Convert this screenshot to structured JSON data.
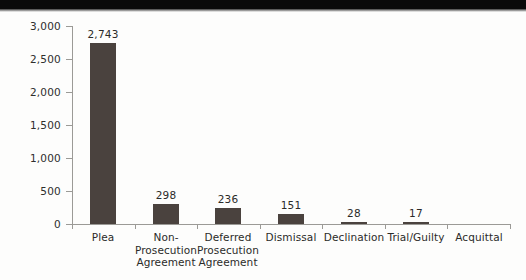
{
  "page": {
    "background_color": "#fdfdfc",
    "scan_band_color": "#0a0a0a"
  },
  "chart_data": {
    "type": "bar",
    "title": "",
    "subtitle": "",
    "xlabel": "",
    "ylabel": "",
    "orientation": "vertical",
    "grid": false,
    "legend": false,
    "legend_position": "none",
    "bar_color": "#4a423e",
    "axis_color": "#9b9a96",
    "text_color": "#2b2b29",
    "ylim": [
      0,
      3000
    ],
    "ytick_values": [
      0,
      500,
      1000,
      1500,
      2000,
      2500,
      3000
    ],
    "ytick_labels": [
      "0",
      "500",
      "1,000",
      "1,500",
      "2,000",
      "2,500",
      "3,000"
    ],
    "categories": [
      "Plea",
      "Non-\nProsecution\nAgreement",
      "Deferred\nProsecution\nAgreement",
      "Dismissal",
      "Declination",
      "Trial/Guilty",
      "Acquittal"
    ],
    "values": [
      2743,
      298,
      236,
      151,
      28,
      17,
      0
    ],
    "value_labels": [
      "2,743",
      "298",
      "236",
      "151",
      "28",
      "17",
      ""
    ],
    "bars": [
      {
        "category": "Plea",
        "category_display": "Plea",
        "value": 2743,
        "label": "2,743",
        "center_x": 105,
        "width": 26
      },
      {
        "category": "Non-Prosecution Agreement",
        "category_display": "Non-\nProsecution\nAgreement",
        "value": 298,
        "label": "298",
        "center_x": 172,
        "width": 26
      },
      {
        "category": "Deferred Prosecution Agreement",
        "category_display": "Deferred\nProsecution\nAgreement",
        "value": 236,
        "label": "236",
        "center_x": 238,
        "width": 26
      },
      {
        "category": "Dismissal",
        "category_display": "Dismissal",
        "value": 151,
        "label": "151",
        "center_x": 305,
        "width": 26
      },
      {
        "category": "Declination",
        "category_display": "Declination",
        "value": 28,
        "label": "28",
        "center_x": 372,
        "width": 26
      },
      {
        "category": "Trial/Guilty",
        "category_display": "Trial/Guilty",
        "value": 17,
        "label": "17",
        "center_x": 438,
        "width": 26
      },
      {
        "category": "Acquittal",
        "category_display": "Acquittal",
        "value": 0,
        "label": "",
        "center_x": 488,
        "width": 26
      }
    ]
  }
}
